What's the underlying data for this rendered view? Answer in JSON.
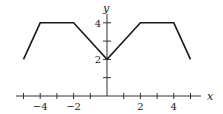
{
  "chart_data": {
    "type": "line",
    "title": "",
    "xlabel": "x",
    "ylabel": "y",
    "xlim": [
      -5.5,
      5.5
    ],
    "ylim": [
      0,
      4.5
    ],
    "grid": false,
    "legend": null,
    "x_ticks": [
      -5,
      -4,
      -3,
      -2,
      -1,
      1,
      2,
      3,
      4,
      5
    ],
    "x_tick_labels": [
      {
        "value": -4,
        "label": "−4"
      },
      {
        "value": -2,
        "label": "−2"
      },
      {
        "value": 2,
        "label": "2"
      },
      {
        "value": 4,
        "label": "4"
      }
    ],
    "y_ticks": [
      1,
      2,
      3,
      4
    ],
    "y_tick_labels": [
      {
        "value": 2,
        "label": "2"
      },
      {
        "value": 4,
        "label": "4"
      }
    ],
    "series": [
      {
        "name": "f(x)",
        "x": [
          -5,
          -4,
          -2,
          0,
          2,
          4,
          5
        ],
        "y": [
          2,
          4,
          4,
          2,
          4,
          4,
          2
        ]
      }
    ]
  },
  "style": {
    "line_color": "#1a1a1a",
    "axis_color": "#333333"
  }
}
